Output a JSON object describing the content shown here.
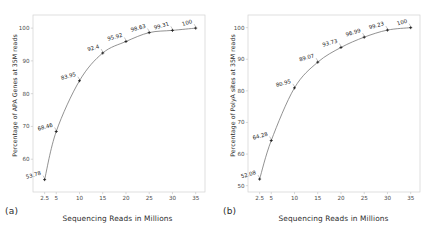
{
  "figure": {
    "background": "#ffffff",
    "line_color": "#6e6e6e",
    "marker_color": "#1a1a1a",
    "axis_color": "#c8c8c8"
  },
  "panels": [
    {
      "tag": "(a)",
      "xlabel": "Sequencing Reads in Millions",
      "ylabel": "Percentage of APA Genes at 35M reads"
    },
    {
      "tag": "(b)",
      "xlabel": "Sequencing Reads in Millions",
      "ylabel": "Percentage of PolyA sites at 35M reads"
    }
  ],
  "chart_data": [
    {
      "type": "line",
      "title": "",
      "panel": "(a)",
      "xlabel": "Sequencing Reads in Millions",
      "ylabel": "Percentage of APA Genes at 35M reads",
      "x": [
        2.5,
        5,
        10,
        15,
        20,
        25,
        30,
        35
      ],
      "values": [
        53.78,
        68.46,
        83.95,
        92.4,
        95.92,
        98.63,
        99.31,
        100
      ],
      "point_labels": [
        "53.78",
        "68.46",
        "83.95",
        "92.4",
        "95.92",
        "98.63",
        "99.31",
        "100"
      ],
      "xticks": [
        2.5,
        5,
        10,
        15,
        20,
        25,
        30,
        35
      ],
      "xticklabels": [
        "2.5",
        "5",
        "10",
        "15",
        "20",
        "25",
        "30",
        "35"
      ],
      "yticks": [
        60,
        70,
        80,
        90,
        100
      ],
      "yticklabels": [
        "60",
        "70",
        "80",
        "90",
        "100"
      ],
      "xlim": [
        0,
        37
      ],
      "ylim": [
        50,
        104
      ],
      "grid": false,
      "legend": null,
      "marker": "plus"
    },
    {
      "type": "line",
      "title": "",
      "panel": "(b)",
      "xlabel": "Sequencing Reads in Millions",
      "ylabel": "Percentage of PolyA sites at 35M reads",
      "x": [
        2.5,
        5,
        10,
        15,
        20,
        25,
        30,
        35
      ],
      "values": [
        52.08,
        64.28,
        80.95,
        89.07,
        93.73,
        96.99,
        99.23,
        100
      ],
      "point_labels": [
        "52.08",
        "64.28",
        "80.95",
        "89.07",
        "93.73",
        "96.99",
        "99.23",
        "100"
      ],
      "xticks": [
        2.5,
        5,
        10,
        15,
        20,
        25,
        30,
        35
      ],
      "xticklabels": [
        "2.5",
        "5",
        "10",
        "15",
        "20",
        "25",
        "30",
        "35"
      ],
      "yticks": [
        50,
        60,
        70,
        80,
        90,
        100
      ],
      "yticklabels": [
        "50",
        "60",
        "70",
        "80",
        "90",
        "100"
      ],
      "xlim": [
        0,
        37
      ],
      "ylim": [
        48,
        104
      ],
      "grid": false,
      "legend": null,
      "marker": "plus"
    }
  ]
}
